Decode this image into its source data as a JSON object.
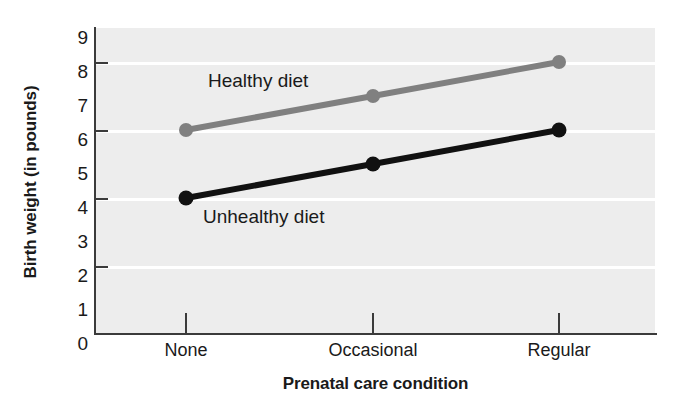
{
  "chart_data": {
    "type": "line",
    "title": "",
    "subtitle": "",
    "xlabel": "Prenatal care condition",
    "ylabel": "Birth weight (in pounds)",
    "categories": [
      "None",
      "Occasional",
      "Regular"
    ],
    "series": [
      {
        "name": "Healthy diet",
        "values": [
          6,
          7,
          8
        ],
        "color": "#808080",
        "marker": "circle",
        "label_position": "above-line-left"
      },
      {
        "name": "Unhealthy diet",
        "values": [
          4,
          5,
          6
        ],
        "color": "#111111",
        "marker": "circle",
        "label_position": "below-line-left"
      }
    ],
    "ylim": [
      0,
      9
    ],
    "xlim_categories": 3,
    "y_tick_labels": [
      "0",
      "1",
      "2",
      "3",
      "4",
      "5",
      "6",
      "7",
      "8",
      "9"
    ],
    "y_tick_values": [
      0,
      1,
      2,
      3,
      4,
      5,
      6,
      7,
      8,
      9
    ],
    "y_gridline_values": [
      2,
      4,
      6,
      8
    ],
    "y_tickmark_values": [
      2,
      4,
      6,
      8
    ],
    "grid": true,
    "grid_color": "#ffffff",
    "plot_background": "#ededed",
    "legend": "inline-series-labels",
    "legend_position": "inside-plot"
  },
  "axes": {
    "y_title": "Birth weight (in pounds)",
    "x_title": "Prenatal care condition",
    "y_ticks": [
      {
        "label": "9",
        "value": 9
      },
      {
        "label": "8",
        "value": 8
      },
      {
        "label": "7",
        "value": 7
      },
      {
        "label": "6",
        "value": 6
      },
      {
        "label": "5",
        "value": 5
      },
      {
        "label": "4",
        "value": 4
      },
      {
        "label": "3",
        "value": 3
      },
      {
        "label": "2",
        "value": 2
      },
      {
        "label": "1",
        "value": 1
      },
      {
        "label": "0",
        "value": 0
      }
    ],
    "x_ticks": [
      {
        "label": "None"
      },
      {
        "label": "Occasional"
      },
      {
        "label": "Regular"
      }
    ]
  },
  "series_labels": {
    "healthy": "Healthy diet",
    "unhealthy": "Unhealthy diet"
  },
  "colors": {
    "healthy_line": "#808080",
    "unhealthy_line": "#111111",
    "axis": "#3b3b3b",
    "plot_bg": "#ededed",
    "grid": "#ffffff",
    "text": "#1a1a1a"
  }
}
